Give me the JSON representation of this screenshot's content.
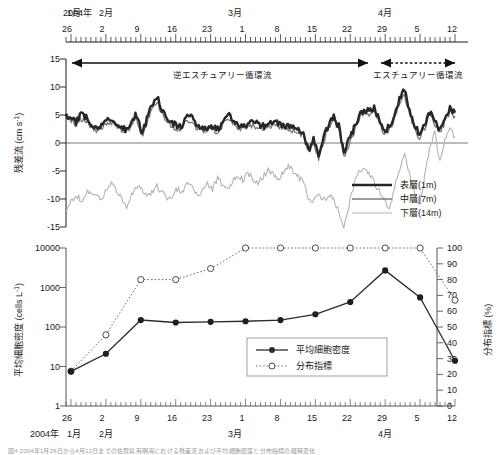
{
  "figure": {
    "year_label": "2004年",
    "months": [
      {
        "label": "1月",
        "x": 66
      },
      {
        "label": "2月",
        "x": 99
      },
      {
        "label": "3月",
        "x": 232
      },
      {
        "label": "4月",
        "x": 382
      }
    ],
    "day_ticks": [
      "26",
      "2",
      "9",
      "16",
      "23",
      "1",
      "8",
      "15",
      "22",
      "29",
      "5",
      "12"
    ],
    "caption": "図4  2004年1月26日から4月12日までの佐賀県有明海における残差流および平均細胞密度と分布指標の経時変化"
  },
  "top_chart": {
    "ylabel": "残差流 (cm s",
    "ylabel_sup": "-1",
    "ylabel_tail": ")",
    "yticks": [
      "15",
      "10",
      "5",
      "0",
      "-5",
      "-10",
      "-15"
    ],
    "ylim": [
      -15,
      15
    ],
    "annotations": [
      {
        "text": "逆エスチュアリー循環流",
        "style": "solid"
      },
      {
        "text": "エスチュアリー循環流",
        "style": "dotted"
      }
    ],
    "legend": [
      {
        "label": "表層(1m)",
        "color": "#262626",
        "width": 2.6
      },
      {
        "label": "中層(7m)",
        "color": "#7a7a7a",
        "width": 1.3
      },
      {
        "label": "下層(14m)",
        "color": "#b5b5b5",
        "width": 1.1
      }
    ]
  },
  "bottom_chart": {
    "ylabel_left": "平均細胞密度 (cells L",
    "ylabel_left_sup": "-1",
    "ylabel_left_tail": ")",
    "ylabel_right": "分布指標 (%)",
    "yticks_left": [
      "10000",
      "1000",
      "100",
      "10",
      "1"
    ],
    "yticks_right": [
      "100",
      "90",
      "80",
      "70",
      "60",
      "50",
      "40",
      "30",
      "20",
      "10",
      "0"
    ],
    "legend": [
      {
        "label": "平均細胞密度",
        "marker": "filled",
        "style": "solid"
      },
      {
        "label": "分布指標",
        "marker": "open",
        "style": "dotted"
      }
    ]
  },
  "chart_data": [
    {
      "type": "line",
      "title": "残差流の経時変化",
      "xlabel": "2004年 1月26日 - 4月12日",
      "ylabel": "残差流 (cm s-1)",
      "ylim": [
        -15,
        15
      ],
      "grid": false,
      "legend_position": "bottom-right",
      "x": [
        0,
        1,
        2,
        3,
        4,
        5,
        6,
        7,
        8,
        9,
        10,
        11,
        12,
        13,
        14,
        15,
        16,
        17,
        18,
        19,
        20,
        21,
        22,
        23,
        24,
        25,
        26,
        27,
        28,
        29,
        30,
        31,
        32,
        33,
        34,
        35,
        36,
        37,
        38,
        39,
        40,
        41,
        42,
        43,
        44,
        45,
        46,
        47,
        48,
        49,
        50,
        51,
        52,
        53,
        54,
        55,
        56,
        57,
        58,
        59,
        60,
        61,
        62,
        63,
        64,
        65,
        66,
        67,
        68,
        69,
        70,
        71,
        72,
        73,
        74,
        75,
        76,
        77
      ],
      "series": [
        {
          "name": "表層(1m)",
          "color": "#262626",
          "values": [
            5.2,
            4.4,
            3.8,
            5.0,
            4.6,
            3.4,
            2.9,
            3.2,
            4.0,
            4.4,
            3.5,
            2.8,
            2.2,
            4.3,
            5.0,
            1.6,
            4.2,
            6.7,
            8.2,
            6.0,
            4.2,
            3.6,
            3.0,
            3.2,
            4.8,
            4.4,
            3.1,
            2.6,
            2.8,
            3.0,
            2.4,
            3.6,
            5.3,
            4.1,
            3.2,
            2.8,
            3.2,
            3.8,
            3.5,
            3.0,
            3.4,
            4.0,
            3.6,
            3.2,
            3.0,
            2.8,
            2.6,
            1.8,
            -1.2,
            0.5,
            -2.0,
            1.0,
            3.2,
            4.8,
            3.0,
            -1.8,
            0.4,
            2.6,
            5.0,
            6.0,
            5.6,
            6.2,
            4.4,
            2.2,
            3.0,
            5.0,
            7.8,
            9.6,
            6.0,
            3.4,
            1.2,
            3.4,
            5.6,
            4.0,
            2.2,
            4.4,
            6.2,
            5.4
          ]
        },
        {
          "name": "中層(7m)",
          "color": "#7a7a7a",
          "values": [
            4.8,
            4.0,
            3.4,
            4.4,
            4.0,
            2.9,
            2.4,
            2.7,
            3.4,
            3.8,
            3.0,
            2.3,
            1.8,
            3.6,
            4.4,
            1.2,
            3.6,
            6.0,
            7.4,
            5.2,
            3.6,
            3.0,
            2.5,
            2.7,
            4.2,
            3.8,
            2.6,
            2.1,
            2.3,
            2.5,
            2.0,
            3.0,
            4.6,
            3.5,
            2.7,
            2.3,
            2.7,
            3.2,
            2.9,
            2.5,
            2.8,
            3.4,
            3.0,
            2.7,
            2.5,
            2.3,
            2.1,
            1.3,
            -1.8,
            0.0,
            -2.6,
            0.5,
            2.6,
            4.2,
            2.4,
            -2.4,
            -0.2,
            2.0,
            4.4,
            5.4,
            5.0,
            5.6,
            3.8,
            1.6,
            2.4,
            4.4,
            7.0,
            8.8,
            5.2,
            2.8,
            0.6,
            2.8,
            5.0,
            3.4,
            1.6,
            3.8,
            5.6,
            4.8
          ]
        },
        {
          "name": "下層(14m)",
          "color": "#b5b5b5",
          "values": [
            -11.8,
            -10.6,
            -9.4,
            -10.2,
            -9.0,
            -8.6,
            -9.8,
            -10.0,
            -8.2,
            -7.4,
            -8.8,
            -9.6,
            -11.8,
            -9.0,
            -7.6,
            -8.2,
            -9.4,
            -9.0,
            -7.8,
            -8.6,
            -10.2,
            -9.4,
            -8.2,
            -9.0,
            -7.0,
            -8.0,
            -9.4,
            -8.6,
            -7.4,
            -8.2,
            -6.2,
            -7.6,
            -8.4,
            -7.0,
            -5.8,
            -6.6,
            -5.4,
            -6.2,
            -7.4,
            -6.0,
            -4.8,
            -5.6,
            -6.4,
            -5.2,
            -4.0,
            -5.0,
            -6.0,
            -7.2,
            -9.6,
            -10.4,
            -9.0,
            -10.2,
            -9.4,
            -10.0,
            -12.2,
            -14.8,
            -11.0,
            -7.4,
            -5.0,
            -4.2,
            -5.6,
            -7.0,
            -8.6,
            -10.0,
            -11.8,
            -8.2,
            -4.6,
            -2.0,
            -5.4,
            -9.0,
            -11.0,
            -6.0,
            -1.0,
            2.0,
            -3.0,
            0.5,
            3.0,
            1.0
          ]
        }
      ]
    },
    {
      "type": "line",
      "title": "平均細胞密度と分布指標",
      "xlabel": "2004年 1月26日 - 4月12日",
      "ylabel": "平均細胞密度 (cells L-1)",
      "ylabel2": "分布指標 (%)",
      "yscale": "log",
      "ylim": [
        1,
        10000
      ],
      "ylim2": [
        0,
        100
      ],
      "grid": false,
      "legend_position": "center-right",
      "categories": [
        "26",
        "2",
        "9",
        "16",
        "23",
        "1",
        "8",
        "15",
        "22",
        "29",
        "5",
        "12"
      ],
      "series": [
        {
          "name": "平均細胞密度",
          "axis": "left",
          "marker": "filled-circle",
          "style": "solid",
          "values": [
            7.5,
            21,
            150,
            130,
            135,
            140,
            150,
            210,
            430,
            2700,
            560,
            14
          ]
        },
        {
          "name": "分布指標",
          "axis": "right",
          "marker": "open-circle",
          "style": "dotted",
          "values": [
            22,
            45,
            80,
            80,
            87,
            100,
            100,
            100,
            100,
            100,
            100,
            67
          ]
        }
      ]
    }
  ]
}
